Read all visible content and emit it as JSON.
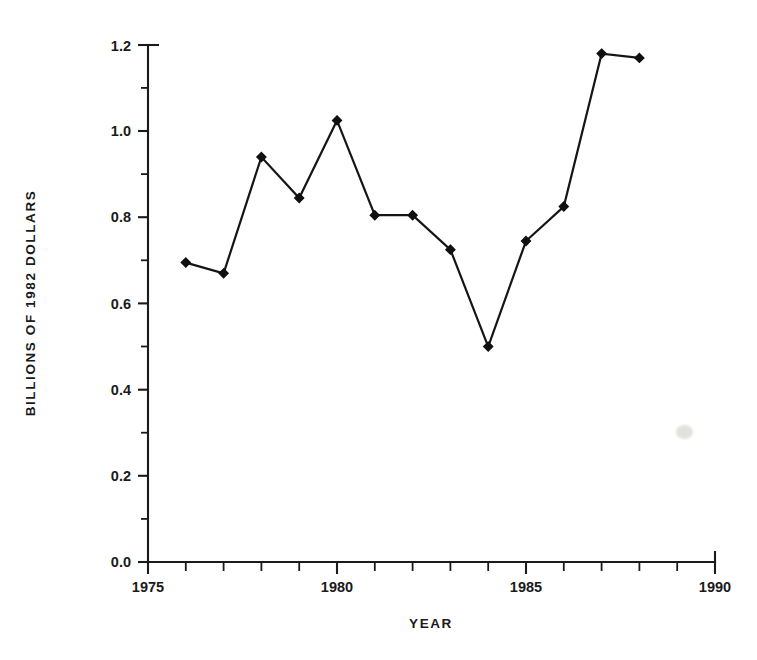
{
  "figure": {
    "background_color": "#ffffff",
    "ink_color": "#1a1a1a",
    "marker_color": "#101010"
  },
  "chart_data": {
    "type": "line",
    "title": "",
    "subtitle": "",
    "xlabel": "YEAR",
    "ylabel": "BILLIONS  OF  1982  DOLLARS",
    "xlim": [
      1975,
      1990
    ],
    "ylim": [
      0.0,
      1.2
    ],
    "grid": false,
    "legend": false,
    "legend_position": "none",
    "x_major_ticks": [
      1975,
      1980,
      1985,
      1990
    ],
    "x_major_tick_labels": [
      "1975",
      "1980",
      "1985",
      "1990"
    ],
    "x_minor_tick_interval": 1,
    "y_major_ticks": [
      0.0,
      0.2,
      0.4,
      0.6,
      0.8,
      1.0,
      1.2
    ],
    "y_major_tick_labels": [
      "0.0",
      "0.2",
      "0.4",
      "0.6",
      "0.8",
      "1.0",
      "1.2"
    ],
    "y_minor_tick_interval": 0.1,
    "marker_style": "filled-diamond",
    "x": [
      1976,
      1977,
      1978,
      1979,
      1980,
      1981,
      1982,
      1983,
      1984,
      1985,
      1986,
      1987,
      1988
    ],
    "values": [
      0.695,
      0.67,
      0.94,
      0.845,
      1.025,
      0.805,
      0.805,
      0.725,
      0.5,
      0.745,
      0.825,
      1.18,
      1.17
    ],
    "series": [
      {
        "name": "Billions of 1982 dollars",
        "values": [
          0.695,
          0.67,
          0.94,
          0.845,
          1.025,
          0.805,
          0.805,
          0.725,
          0.5,
          0.745,
          0.825,
          1.18,
          1.17
        ]
      }
    ],
    "annotations": []
  }
}
